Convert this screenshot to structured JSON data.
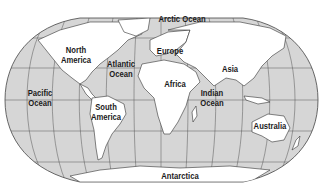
{
  "map": {
    "projection": "Robinson-style world map",
    "colors": {
      "ocean": "#d6d6d6",
      "land": "#ffffff",
      "outline": "#333333",
      "grid": "#555555",
      "background": "#ffffff"
    },
    "labels": {
      "arctic_ocean": "Arctic Ocean",
      "north_america": [
        "North",
        "America"
      ],
      "atlantic_ocean": [
        "Atlantic",
        "Ocean"
      ],
      "europe": "Europe",
      "asia": "Asia",
      "africa": "Africa",
      "pacific_ocean": [
        "Pacific",
        "Ocean"
      ],
      "indian_ocean": [
        "Indian",
        "Ocean"
      ],
      "south_america": [
        "South",
        "America"
      ],
      "australia": "Australia",
      "antarctica": "Antarctica"
    }
  }
}
